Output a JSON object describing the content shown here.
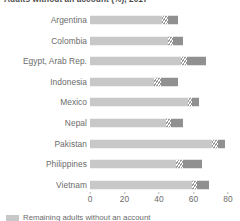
{
  "chart_data": {
    "type": "bar",
    "orientation": "horizontal",
    "stacked": true,
    "title": "Adults without an account (%), 2017",
    "xlabel": "",
    "ylabel": "",
    "xlim": [
      0,
      80
    ],
    "xticks": [
      0,
      20,
      40,
      60,
      80
    ],
    "xtick_labels": [
      "0",
      "20",
      "40",
      "60",
      "80"
    ],
    "grid": false,
    "legend_position": "bottom-left",
    "categories": [
      "Argentina",
      "Colombia",
      "Egypt, Arab Rep.",
      "Indonesia",
      "Mexico",
      "Nepal",
      "Pakistan",
      "Philippines",
      "Vietnam"
    ],
    "series": [
      {
        "name": "Remaining adults without an account",
        "style": "solid-light",
        "color": "#c8c8c8",
        "values": [
          42,
          45,
          53,
          37,
          57,
          44,
          71,
          50,
          59
        ]
      },
      {
        "name": "Hatched segment",
        "style": "hatched",
        "color": "#9a9a9a",
        "values": [
          3,
          3,
          3,
          4,
          2,
          3,
          3,
          4,
          3
        ]
      },
      {
        "name": "Darker segment",
        "style": "solid-dark",
        "color": "#909090",
        "values": [
          6,
          6,
          11,
          10,
          4,
          7,
          4,
          11,
          7
        ]
      }
    ],
    "totals": [
      51,
      54,
      67,
      51,
      63,
      54,
      78,
      65,
      69
    ]
  },
  "legend": {
    "items": [
      {
        "swatch_color": "#c8c8c8",
        "label": "Remaining adults without an account"
      }
    ]
  },
  "colors": {
    "light": "#c8c8c8",
    "dark": "#909090",
    "hatch": "#9a9a9a",
    "text": "#6b6b6b",
    "title": "#4a4a4a",
    "background": "#ffffff"
  }
}
